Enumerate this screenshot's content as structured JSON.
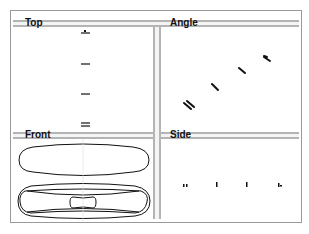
{
  "viewports": [
    {
      "id": "top",
      "label": "Top"
    },
    {
      "id": "angle",
      "label": "Angle"
    },
    {
      "id": "front",
      "label": "Front"
    },
    {
      "id": "side",
      "label": "Side"
    }
  ],
  "colors": {
    "frame": "#9a9a9a",
    "divider": "#b4b4b4",
    "geometry": "#111111",
    "background": "#ffffff"
  }
}
